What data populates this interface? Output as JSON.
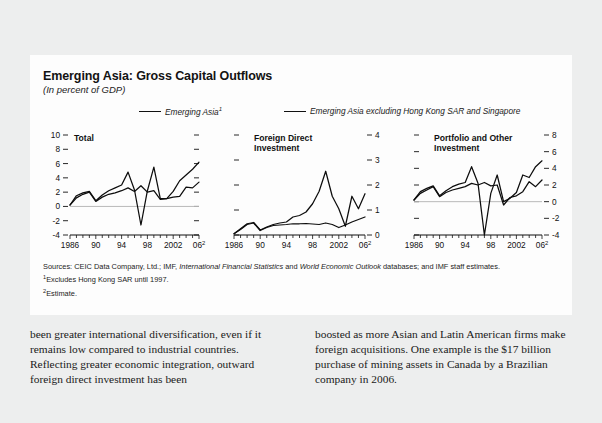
{
  "figure": {
    "title": "Emerging Asia: Gross Capital Outflows",
    "subtitle": "(In percent of GDP)",
    "legend": [
      {
        "label": "Emerging Asia",
        "superscript": "1"
      },
      {
        "label": "Emerging Asia excluding Hong Kong SAR and Singapore",
        "superscript": ""
      }
    ],
    "sources_prefix": "Sources: CEIC Data Company, Ltd.; IMF, ",
    "sources_italic1": "International Financial Statistics",
    "sources_mid": " and ",
    "sources_italic2": "World Economic Outlook",
    "sources_suffix": " databases; and IMF staff estimates.",
    "footnote1_marker": "1",
    "footnote1": "Excludes Hong Kong SAR until 1997.",
    "footnote2_marker": "2",
    "footnote2": "Estimate."
  },
  "body": {
    "left_column": "been greater international diversification, even if it remains low compared to industrial countries. Reflecting greater economic integration, outward foreign direct investment has been",
    "right_column": "boosted as more Asian and Latin American firms make foreign acquisitions. One example is the $17 billion purchase of mining assets in Canada by a Brazilian company in 2006."
  },
  "chart_data": [
    {
      "type": "line",
      "title": "Total",
      "panel_index": 0,
      "xlabel": "",
      "ylabel": "",
      "ylim": [
        -4,
        10
      ],
      "yticks": [
        -4,
        -2,
        0,
        2,
        4,
        6,
        8,
        10
      ],
      "ytick_labels": [
        "-4",
        "-2",
        "0",
        "2",
        "4",
        "6",
        "8",
        "10"
      ],
      "y_axis_side": "left",
      "xlim": [
        1986,
        2006
      ],
      "xticks": [
        1986,
        1990,
        1994,
        1998,
        2002,
        2006
      ],
      "xtick_labels": [
        "1986",
        "90",
        "94",
        "98",
        "2002",
        "06"
      ],
      "xtick_last_superscript": "2",
      "grid": false,
      "zero_line": true,
      "legend_position": "above-figure",
      "x": [
        1986,
        1987,
        1988,
        1989,
        1990,
        1991,
        1992,
        1993,
        1994,
        1995,
        1996,
        1997,
        1998,
        1999,
        2000,
        2001,
        2002,
        2003,
        2004,
        2005,
        2006
      ],
      "series": [
        {
          "name": "Emerging Asia",
          "values": [
            0.2,
            1.5,
            1.9,
            2.1,
            0.8,
            1.6,
            2.2,
            2.6,
            3.0,
            4.8,
            2.3,
            -2.6,
            2.2,
            5.5,
            1.1,
            1.1,
            2.1,
            3.6,
            4.4,
            5.2,
            6.2
          ]
        },
        {
          "name": "Emerging Asia excluding Hong Kong SAR and Singapore",
          "values": [
            0.2,
            1.2,
            1.7,
            2.0,
            0.7,
            1.3,
            1.7,
            1.9,
            2.2,
            2.6,
            2.1,
            2.9,
            2.0,
            2.2,
            1.0,
            1.1,
            1.3,
            1.4,
            2.7,
            2.6,
            3.4
          ]
        }
      ]
    },
    {
      "type": "line",
      "title": "Foreign Direct\nInvestment",
      "panel_index": 1,
      "xlabel": "",
      "ylabel": "",
      "ylim": [
        0,
        4
      ],
      "yticks": [
        0,
        1,
        2,
        3,
        4
      ],
      "ytick_labels": [
        "0",
        "1",
        "2",
        "3",
        "4"
      ],
      "y_axis_side": "right",
      "xlim": [
        1986,
        2006
      ],
      "xticks": [
        1986,
        1990,
        1994,
        1998,
        2002,
        2006
      ],
      "xtick_labels": [
        "1986",
        "90",
        "94",
        "98",
        "2002",
        "06"
      ],
      "xtick_last_superscript": "2",
      "grid": false,
      "zero_line": false,
      "x": [
        1986,
        1987,
        1988,
        1989,
        1990,
        1991,
        1992,
        1993,
        1994,
        1995,
        1996,
        1997,
        1998,
        1999,
        2000,
        2001,
        2002,
        2003,
        2004,
        2005,
        2006
      ],
      "series": [
        {
          "name": "Emerging Asia",
          "values": [
            0.05,
            0.25,
            0.45,
            0.5,
            0.2,
            0.32,
            0.42,
            0.48,
            0.52,
            0.72,
            0.78,
            0.92,
            1.25,
            1.75,
            2.55,
            1.55,
            1.05,
            0.35,
            1.55,
            1.05,
            1.65
          ]
        },
        {
          "name": "Emerging Asia excluding Hong Kong SAR and Singapore",
          "values": [
            0.05,
            0.22,
            0.42,
            0.48,
            0.18,
            0.3,
            0.38,
            0.4,
            0.42,
            0.45,
            0.45,
            0.46,
            0.44,
            0.42,
            0.48,
            0.42,
            0.3,
            0.4,
            0.52,
            0.62,
            0.72
          ]
        }
      ]
    },
    {
      "type": "line",
      "title": "Portfolio and Other\nInvestment",
      "panel_index": 2,
      "xlabel": "",
      "ylabel": "",
      "ylim": [
        -4,
        8
      ],
      "yticks": [
        -4,
        -2,
        0,
        2,
        4,
        6,
        8
      ],
      "ytick_labels": [
        "-4",
        "-2",
        "0",
        "2",
        "4",
        "6",
        "8"
      ],
      "y_axis_side": "right",
      "xlim": [
        1986,
        2006
      ],
      "xticks": [
        1986,
        1990,
        1994,
        1998,
        2002,
        2006
      ],
      "xtick_labels": [
        "1986",
        "90",
        "94",
        "98",
        "2002",
        "06"
      ],
      "xtick_last_superscript": "2",
      "grid": false,
      "zero_line": true,
      "x": [
        1986,
        1987,
        1988,
        1989,
        1990,
        1991,
        1992,
        1993,
        1994,
        1995,
        1996,
        1997,
        1998,
        1999,
        2000,
        2001,
        2002,
        2003,
        2004,
        2005,
        2006
      ],
      "series": [
        {
          "name": "Emerging Asia",
          "values": [
            0.2,
            1.2,
            1.6,
            1.9,
            0.7,
            1.3,
            1.8,
            2.1,
            2.3,
            4.2,
            2.2,
            -4.0,
            1.0,
            3.2,
            0.0,
            0.4,
            1.1,
            3.2,
            2.9,
            4.2,
            4.9
          ]
        },
        {
          "name": "Emerging Asia excluding Hong Kong SAR and Singapore",
          "values": [
            0.2,
            1.0,
            1.4,
            1.8,
            0.6,
            1.1,
            1.4,
            1.6,
            1.8,
            2.2,
            2.0,
            2.3,
            1.9,
            2.0,
            -0.4,
            0.5,
            0.7,
            1.2,
            2.4,
            1.8,
            2.6
          ]
        }
      ]
    }
  ]
}
